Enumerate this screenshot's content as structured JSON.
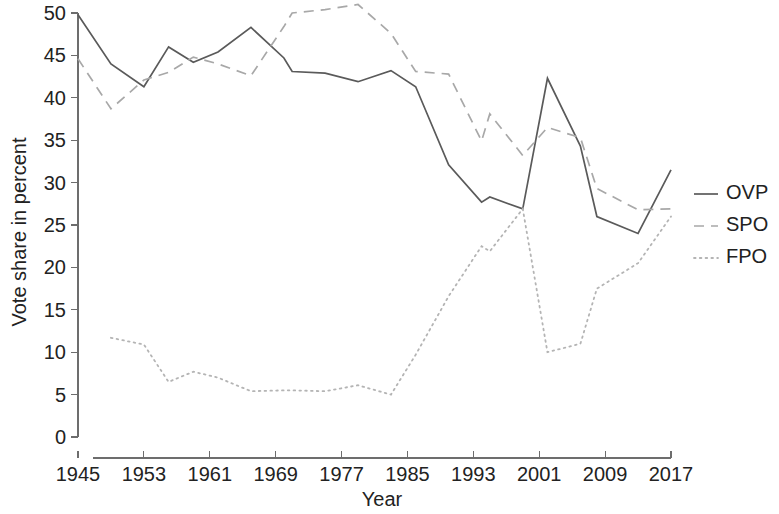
{
  "chart_data": {
    "type": "line",
    "title": "",
    "xlabel": "Year",
    "ylabel": "Vote share in percent",
    "xlim": [
      1945,
      2017
    ],
    "ylim": [
      0,
      50
    ],
    "xticks": [
      1945,
      1953,
      1961,
      1969,
      1977,
      1985,
      1993,
      2001,
      2009,
      2017
    ],
    "yticks": [
      0,
      5,
      10,
      15,
      20,
      25,
      30,
      35,
      40,
      45,
      50
    ],
    "grid": false,
    "legend_position": "right",
    "series": [
      {
        "name": "OVP",
        "style": "solid",
        "color": "#5a5a5a",
        "x": [
          1945,
          1949,
          1953,
          1956,
          1959,
          1962,
          1966,
          1970,
          1971,
          1975,
          1979,
          1983,
          1986,
          1990,
          1994,
          1995,
          1999,
          2002,
          2006,
          2008,
          2013,
          2017
        ],
        "values": [
          49.8,
          44.0,
          41.3,
          46.0,
          44.2,
          45.4,
          48.3,
          44.7,
          43.1,
          42.9,
          41.9,
          43.2,
          41.3,
          32.1,
          27.7,
          28.3,
          26.9,
          42.3,
          34.3,
          26.0,
          24.0,
          31.5
        ]
      },
      {
        "name": "SPO",
        "style": "dashed",
        "color": "#a8a8a8",
        "x": [
          1945,
          1949,
          1953,
          1956,
          1959,
          1962,
          1966,
          1970,
          1971,
          1975,
          1979,
          1983,
          1986,
          1990,
          1994,
          1995,
          1999,
          2002,
          2006,
          2008,
          2013,
          2017
        ],
        "values": [
          44.6,
          38.7,
          42.1,
          43.0,
          44.8,
          44.0,
          42.6,
          48.4,
          50.0,
          50.4,
          51.0,
          47.6,
          43.1,
          42.8,
          34.9,
          38.1,
          33.2,
          36.5,
          35.3,
          29.3,
          26.8,
          26.9
        ]
      },
      {
        "name": "FPO",
        "style": "dotted",
        "color": "#b4b4b4",
        "x": [
          1949,
          1953,
          1956,
          1959,
          1962,
          1966,
          1970,
          1971,
          1975,
          1979,
          1983,
          1986,
          1990,
          1994,
          1995,
          1999,
          2002,
          2006,
          2008,
          2013,
          2017
        ],
        "values": [
          11.7,
          10.9,
          6.5,
          7.7,
          7.0,
          5.4,
          5.5,
          5.5,
          5.4,
          6.1,
          5.0,
          9.7,
          16.6,
          22.5,
          21.9,
          26.9,
          10.0,
          11.0,
          17.5,
          20.5,
          26.0
        ]
      }
    ]
  },
  "axes": {
    "y_title": "Vote share in percent",
    "x_title": "Year",
    "y_tick_labels": [
      "50",
      "45",
      "40",
      "35",
      "30",
      "25",
      "20",
      "15",
      "10",
      "5",
      "0"
    ],
    "x_tick_labels": [
      "1945",
      "1953",
      "1961",
      "1969",
      "1977",
      "1985",
      "1993",
      "2001",
      "2009",
      "2017"
    ]
  },
  "legend": {
    "entries": [
      {
        "label": "OVP",
        "style": "solid"
      },
      {
        "label": "SPO",
        "style": "dashed"
      },
      {
        "label": "FPO",
        "style": "dotted"
      }
    ]
  }
}
